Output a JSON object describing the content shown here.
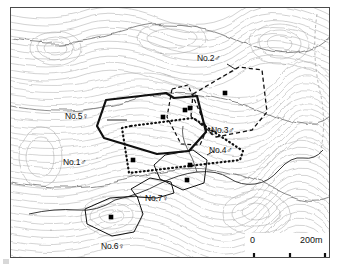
{
  "figure": {
    "type": "topographic-map"
  },
  "chart_data": {
    "type": "map",
    "title": "",
    "grid": false,
    "legend_position": "none",
    "scale_bar": {
      "min_label": "0",
      "max_label": "200m",
      "units": "m",
      "span": 200,
      "ticks": [
        0,
        100,
        200
      ]
    },
    "ranges": [
      {
        "id": "No.1",
        "label": "No.1♂",
        "sex": "male",
        "line_style": "dotted",
        "line_width": 2.2,
        "label_x": 62,
        "label_y": 155,
        "points": "120,118 182,110 232,143 229,152 118,165 111,120",
        "dots": [
          [
            122,
            152
          ]
        ]
      },
      {
        "id": "No.2",
        "label": "No.2♂",
        "sex": "male",
        "line_style": "dashed",
        "line_width": 1.3,
        "label_x": 196,
        "label_y": 53,
        "points": "182,86 228,59 251,62 256,104 241,122 205,129 180,108",
        "dots": [
          [
            214,
            85
          ]
        ]
      },
      {
        "id": "No.3",
        "label": "No.3♂",
        "sex": "male",
        "line_style": "dashed",
        "line_width": 1.2,
        "label_x": 209,
        "label_y": 126,
        "points": "161,81 177,77 196,121 189,137 170,136 156,109",
        "dots": [
          [
            179,
            100
          ]
        ]
      },
      {
        "id": "No.4",
        "label": "No.4♂",
        "sex": "male",
        "line_style": "solid",
        "line_width": 1.0,
        "label_x": 205,
        "label_y": 145,
        "points": "154,147 182,142 196,152 193,175 172,182 149,171 143,157",
        "dots": [
          [
            179,
            157
          ],
          [
            176,
            172
          ]
        ]
      },
      {
        "id": "No.5",
        "label": "No.5♀",
        "sex": "female",
        "line_style": "solid",
        "line_width": 2.2,
        "label_x": 63,
        "label_y": 109,
        "points": "95,92 155,85 163,90 186,88 195,124 178,143 146,146 93,130 86,118",
        "dots": [
          [
            152,
            109
          ],
          [
            174,
            102
          ]
        ]
      },
      {
        "id": "No.6",
        "label": "No.6♀",
        "sex": "female",
        "line_style": "solid",
        "line_width": 1.0,
        "label_x": 98,
        "label_y": 241,
        "points": "74,201 99,190 126,188 132,206 123,224 101,228 76,216",
        "dots": [
          [
            100,
            209
          ]
        ]
      },
      {
        "id": "No.7",
        "label": "No.7♀",
        "sex": "female",
        "line_style": "solid",
        "line_width": 1.0,
        "label_x": 143,
        "label_y": 192,
        "points": "120,181 139,170 160,174 163,185 146,190 126,189",
        "dots": []
      }
    ]
  },
  "scale": {
    "zero": "0",
    "max": "200m"
  },
  "labels": {
    "no1": "No.1♂",
    "no2": "No.2♂",
    "no3": "No.3♂",
    "no4": "No.4♂",
    "no5": "No.5♀",
    "no6": "No.6♀",
    "no7": "No.7♀"
  }
}
